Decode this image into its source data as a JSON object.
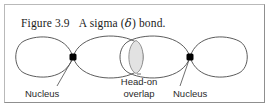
{
  "figure": {
    "caption_prefix": "Figure 3.9",
    "caption_text_before": "A sigma (",
    "caption_greek": "δ",
    "caption_text_after": ") bond.",
    "border_color": "#b9b9b9"
  },
  "diagram": {
    "type": "orbital-overlap-diagram",
    "stroke_color": "#4a4a4a",
    "nucleus_color": "#000000",
    "overlap_fill": "#e2e2e2",
    "axis_y": 57,
    "nuclei": [
      {
        "name": "left-nucleus",
        "x": 73,
        "y": 57
      },
      {
        "name": "right-nucleus",
        "x": 190,
        "y": 57
      }
    ],
    "lobe_tips": {
      "far_left_x": 16,
      "far_right_x": 247
    },
    "overlap_region": {
      "left_x": 124,
      "right_x": 148,
      "center_x": 136
    }
  },
  "labels": {
    "nucleus_left": "Nucleus",
    "overlap_line1": "Head-on",
    "overlap_line2": "overlap",
    "nucleus_right": "Nucleus"
  }
}
